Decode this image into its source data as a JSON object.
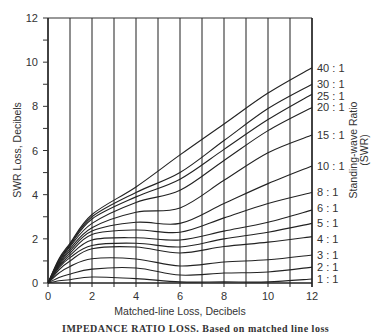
{
  "chart_data": {
    "type": "line",
    "title": "",
    "xlabel": "Matched-line Loss, Decibels",
    "ylabel": "SWR Loss, Decibels",
    "right_label_line1": "Standing-wave Ratio",
    "right_label_line2": "(SWR)",
    "xlim": [
      0,
      12
    ],
    "ylim": [
      0,
      12
    ],
    "x_ticks": [
      0,
      2,
      4,
      6,
      8,
      10,
      12
    ],
    "y_ticks": [
      0,
      2,
      4,
      6,
      8,
      10,
      12
    ],
    "grid": "vertical lines at every 1 dB",
    "legend_position": "right edge labels",
    "x": [
      0,
      0.5,
      1,
      2,
      4,
      6,
      8,
      10,
      12
    ],
    "series": [
      {
        "name": "40:1",
        "values": [
          0,
          1.1,
          1.8,
          3.1,
          4.35,
          5.8,
          7.2,
          8.6,
          9.75
        ]
      },
      {
        "name": "30:1",
        "values": [
          0,
          1.05,
          1.75,
          3.0,
          4.1,
          5.0,
          6.45,
          7.9,
          9.0
        ]
      },
      {
        "name": "25:1",
        "values": [
          0,
          1.0,
          1.7,
          2.9,
          3.9,
          4.7,
          6.05,
          7.4,
          8.55
        ]
      },
      {
        "name": "20:1",
        "values": [
          0,
          0.95,
          1.65,
          2.7,
          3.65,
          4.2,
          5.55,
          6.9,
          7.95
        ]
      },
      {
        "name": "15:1",
        "values": [
          0,
          0.9,
          1.55,
          2.5,
          3.2,
          3.4,
          4.65,
          5.9,
          6.7
        ]
      },
      {
        "name": "10:1",
        "values": [
          0,
          0.85,
          1.45,
          2.35,
          2.75,
          2.7,
          3.6,
          4.5,
          5.3
        ]
      },
      {
        "name": "8:1",
        "values": [
          0,
          0.8,
          1.35,
          2.2,
          2.4,
          2.3,
          2.95,
          3.6,
          4.1
        ]
      },
      {
        "name": "6:1",
        "values": [
          0,
          0.75,
          1.25,
          1.95,
          2.05,
          1.95,
          2.35,
          2.75,
          3.3
        ]
      },
      {
        "name": "5:1",
        "values": [
          0,
          0.7,
          1.15,
          1.7,
          1.8,
          1.63,
          2.0,
          2.3,
          2.7
        ]
      },
      {
        "name": "4:1",
        "values": [
          0,
          0.6,
          1.0,
          1.55,
          1.63,
          1.36,
          1.65,
          1.85,
          2.1
        ]
      },
      {
        "name": "3:1",
        "values": [
          0,
          0.45,
          0.75,
          1.1,
          1.09,
          0.77,
          0.95,
          1.05,
          1.27
        ]
      },
      {
        "name": "2:1",
        "values": [
          0,
          0.25,
          0.4,
          0.63,
          0.68,
          0.36,
          0.45,
          0.5,
          0.72
        ]
      },
      {
        "name": "1:1",
        "values": [
          0,
          0.1,
          0.15,
          0.27,
          0.2,
          0.05,
          0.05,
          0.05,
          0.18
        ]
      }
    ]
  },
  "caption": "IMPEDANCE RATIO LOSS. Based on matched line loss"
}
